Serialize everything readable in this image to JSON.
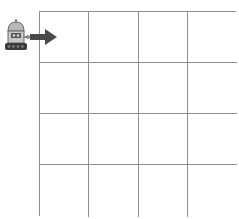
{
  "board": {
    "rows": 4,
    "cols": 4,
    "line_color": "#8e8e8e",
    "background": "#ffffff",
    "cells": [
      [
        "",
        "",
        "",
        ""
      ],
      [
        "",
        "",
        "",
        ""
      ],
      [
        "",
        "",
        "",
        ""
      ],
      [
        "",
        "",
        "",
        ""
      ]
    ]
  },
  "agent": {
    "icon": "robot-icon",
    "position": "outside-left-of-row-1",
    "facing": "right",
    "direction_indicator": "arrow-right-icon",
    "arrow_color": "#4a4a4a"
  }
}
